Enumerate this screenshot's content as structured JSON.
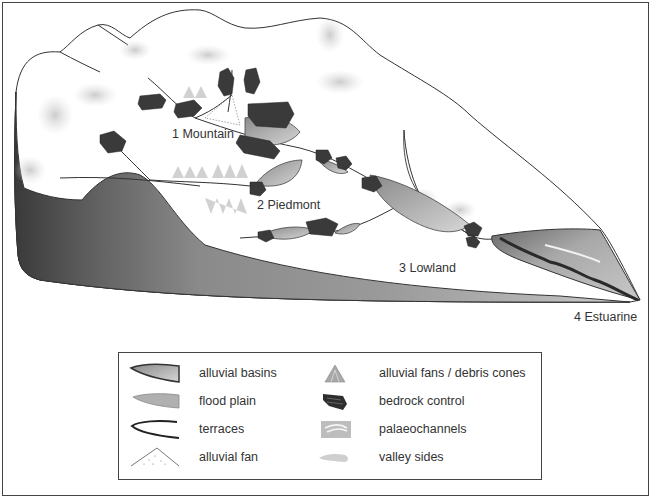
{
  "diagram": {
    "zones": [
      {
        "id": "mountain",
        "label": "1 Mountain"
      },
      {
        "id": "piedmont",
        "label": "2 Piedmont"
      },
      {
        "id": "lowland",
        "label": "3 Lowland"
      },
      {
        "id": "estuarine",
        "label": "4 Estuarine"
      }
    ]
  },
  "legend": {
    "left_column": [
      {
        "icon": "alluvial-basins-icon",
        "label": "alluvial basins"
      },
      {
        "icon": "flood-plain-icon",
        "label": "flood plain"
      },
      {
        "icon": "terraces-icon",
        "label": "terraces"
      },
      {
        "icon": "alluvial-fan-icon",
        "label": "alluvial fan"
      }
    ],
    "right_column": [
      {
        "icon": "alluvial-fans-debris-cones-icon",
        "label": "alluvial fans / debris cones"
      },
      {
        "icon": "bedrock-control-icon",
        "label": "bedrock control"
      },
      {
        "icon": "palaeochannels-icon",
        "label": "palaeochannels"
      },
      {
        "icon": "valley-sides-icon",
        "label": "valley sides"
      }
    ]
  },
  "colors": {
    "outline": "#333333",
    "basin_dark": "#555555",
    "basin_light": "#bdbdbd",
    "valley_shade": "#c8c8c8",
    "bedrock": "#3a3a3a"
  }
}
